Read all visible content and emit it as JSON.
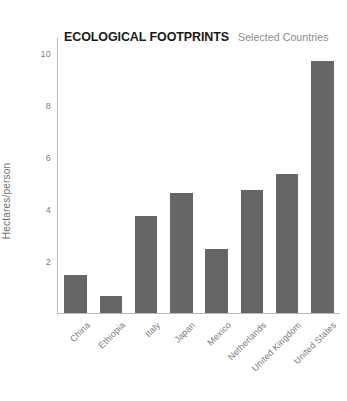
{
  "chart_data": {
    "type": "bar",
    "title": "ECOLOGICAL FOOTPRINTS",
    "subtitle": "Selected Countries",
    "xlabel": "",
    "ylabel": "Hectares/person",
    "ylim": [
      0,
      10.6
    ],
    "yticks": [
      2,
      4,
      6,
      8,
      10
    ],
    "ytick_labels": [
      "2",
      "4",
      "6",
      "8",
      "10"
    ],
    "grid": false,
    "legend": false,
    "bar_color": "#666666",
    "axis_color": "#b9b9b9",
    "categories": [
      "China",
      "Ethiopia",
      "Italy",
      "Japan",
      "Mexico",
      "Netherlands",
      "United Kingdom",
      "United States"
    ],
    "values": [
      1.45,
      0.67,
      3.75,
      4.62,
      2.45,
      4.75,
      5.35,
      9.7
    ]
  }
}
